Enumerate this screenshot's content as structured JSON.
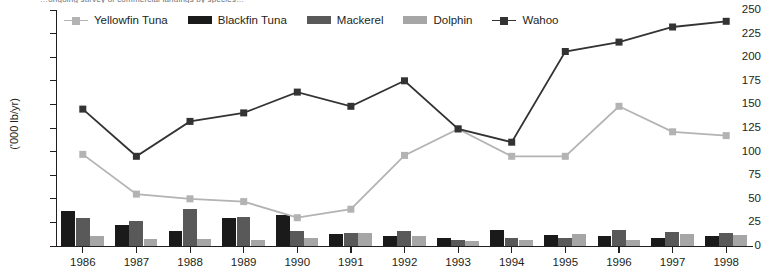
{
  "title_clipped": "…ongoing survey of commercial landings by species…",
  "axis": {
    "ylabel": "('000 lb/yr)",
    "yticks": [
      0,
      25,
      50,
      75,
      100,
      125,
      150,
      175,
      200,
      225,
      250
    ],
    "ymin": 0,
    "ymax": 250,
    "xticks": [
      "1986",
      "1987",
      "1988",
      "1989",
      "1990",
      "1991",
      "1992",
      "1993",
      "1994",
      "1995",
      "1996",
      "1997",
      "1998"
    ]
  },
  "legend": {
    "position": "top",
    "items": [
      {
        "label": "Yellowfin Tuna",
        "color": "#b3b3b3",
        "style": "line"
      },
      {
        "label": "Blackfin Tuna",
        "color": "#1a1a1a",
        "style": "bar"
      },
      {
        "label": "Mackerel",
        "color": "#595959",
        "style": "bar"
      },
      {
        "label": "Dolphin",
        "color": "#a6a6a6",
        "style": "bar"
      },
      {
        "label": "Wahoo",
        "color": "#333333",
        "style": "line"
      }
    ]
  },
  "chart_data": {
    "type": "bar",
    "title": "",
    "xlabel": "",
    "ylabel": "('000 lb/yr)",
    "ylim": [
      0,
      250
    ],
    "grid": false,
    "legend_position": "top",
    "categories": [
      "1986",
      "1987",
      "1988",
      "1989",
      "1990",
      "1991",
      "1992",
      "1993",
      "1994",
      "1995",
      "1996",
      "1997",
      "1998"
    ],
    "series": [
      {
        "name": "Yellowfin Tuna",
        "type": "line",
        "marker": "square",
        "color": "#b3b3b3",
        "values": [
          97,
          55,
          50,
          47,
          30,
          39,
          96,
          124,
          95,
          95,
          148,
          121,
          117
        ]
      },
      {
        "name": "Blackfin Tuna",
        "type": "bar",
        "color": "#1a1a1a",
        "values": [
          37,
          22,
          16,
          30,
          33,
          13,
          11,
          9,
          17,
          12,
          11,
          8,
          11
        ]
      },
      {
        "name": "Mackerel",
        "type": "bar",
        "color": "#595959",
        "values": [
          30,
          26,
          39,
          31,
          16,
          14,
          16,
          6,
          8,
          8,
          17,
          15,
          14
        ]
      },
      {
        "name": "Dolphin",
        "type": "bar",
        "color": "#a6a6a6",
        "values": [
          11,
          7,
          7,
          6,
          9,
          14,
          11,
          5,
          6,
          13,
          6,
          13,
          12
        ]
      },
      {
        "name": "Wahoo",
        "type": "line",
        "marker": "square",
        "color": "#333333",
        "values": [
          145,
          95,
          132,
          141,
          163,
          148,
          175,
          124,
          110,
          206,
          216,
          232,
          238
        ]
      }
    ]
  }
}
